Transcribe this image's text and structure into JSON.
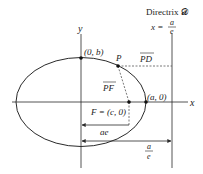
{
  "diagram": {
    "type": "ellipse-focus-directrix",
    "axes": {
      "x_label": "x",
      "y_label": "y"
    },
    "directrix": {
      "title": "Directrix 𝓓",
      "equation_lhs": "x =",
      "equation_num": "a",
      "equation_den": "e"
    },
    "points": {
      "vertex_top": "(0, b)",
      "point_p": "P",
      "vertex_right": "(a, 0)",
      "focus": "F = (c, 0)"
    },
    "segments": {
      "pd": "PD",
      "pf": "PF"
    },
    "dimensions": {
      "ae": "ae",
      "a_over_e_num": "a",
      "a_over_e_den": "e"
    },
    "colors": {
      "stroke": "#2a2a2a",
      "dashed": "#555555"
    }
  }
}
